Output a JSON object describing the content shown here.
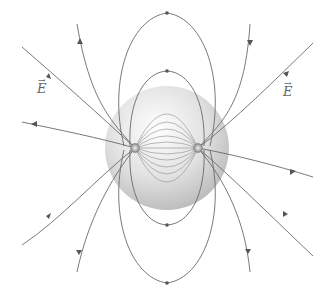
{
  "diagram": {
    "labels": {
      "left_field": "E",
      "right_field": "E",
      "vector_mark": "→"
    },
    "sphere": {
      "cx": 167,
      "cy": 148,
      "r": 62,
      "fill_light": "#f4f4f4",
      "fill_dark": "#bdbdbd"
    },
    "charges": [
      {
        "name": "left-charge",
        "cx": 135,
        "cy": 148
      },
      {
        "name": "right-charge",
        "cx": 198,
        "cy": 148
      }
    ],
    "colors": {
      "line": "#6a6a6a",
      "arrow": "#555555",
      "background": "#ffffff"
    }
  }
}
